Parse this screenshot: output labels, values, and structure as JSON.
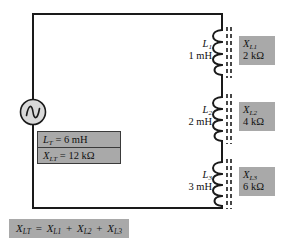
{
  "diagram": {
    "colors": {
      "wire": "#1a1a1a",
      "chip_fill": "#a9a9a9",
      "box_border": "#3a3a3a",
      "source_fill": "#d9d9d9",
      "background": "#ffffff"
    }
  },
  "source": {
    "name": "ac-voltage-source",
    "symbol": "sine-wave"
  },
  "inductors": [
    {
      "designator": "L",
      "index": "1",
      "inductance": "1 mH",
      "reactance_symbol": "X",
      "reactance_index": "L1",
      "reactance_value": "2 kΩ"
    },
    {
      "designator": "L",
      "index": "2",
      "inductance": "2 mH",
      "reactance_symbol": "X",
      "reactance_index": "L2",
      "reactance_value": "4 kΩ"
    },
    {
      "designator": "L",
      "index": "3",
      "inductance": "3 mH",
      "reactance_symbol": "X",
      "reactance_index": "L3",
      "reactance_value": "6 kΩ"
    }
  ],
  "total_box": {
    "inductance_symbol": "L",
    "inductance_index": "T",
    "inductance_equation": "= 6 mH",
    "reactance_symbol": "X",
    "reactance_index": "LT",
    "reactance_equation": "= 12 kΩ"
  },
  "formula": {
    "lhs_symbol": "X",
    "lhs_index": "LT",
    "equals": "=",
    "term1_symbol": "X",
    "term1_index": "L1",
    "plus1": "+",
    "term2_symbol": "X",
    "term2_index": "L2",
    "plus2": "+",
    "term3_symbol": "X",
    "term3_index": "L3"
  }
}
